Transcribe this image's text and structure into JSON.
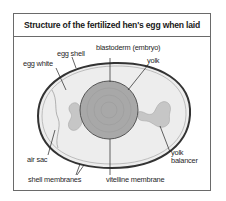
{
  "figure": {
    "title": "Structure of the fertilized hen's egg when laid",
    "labels": {
      "egg_shell": "egg shell",
      "egg_white": "egg white",
      "blastoderm": "blastoderm (embryo)",
      "yolk": "yolk",
      "air_sac": "air sac",
      "yolk_balancer_line1": "yolk",
      "yolk_balancer_line2": "balancer",
      "shell_membranes": "shell membranes",
      "vitelline_membrane": "vitelline membrane"
    },
    "colors": {
      "frame": "#6a6a6a",
      "shell": "#3a3a3a",
      "egg_white": "#ececec",
      "yolk": "#a9a9a9",
      "balancer": "#c4c4c4"
    }
  }
}
